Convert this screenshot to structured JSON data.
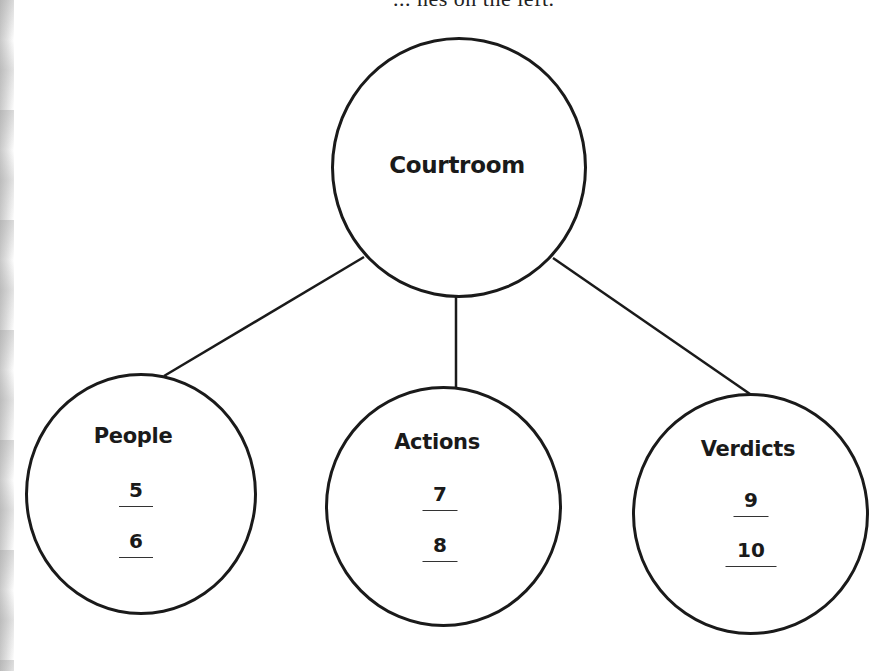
{
  "header_fragment": "... nes on the left.",
  "diagram": {
    "root": {
      "label": "Courtroom"
    },
    "children": [
      {
        "label": "People",
        "blanks": [
          "5",
          "6"
        ]
      },
      {
        "label": "Actions",
        "blanks": [
          "7",
          "8"
        ]
      },
      {
        "label": "Verdicts",
        "blanks": [
          "9",
          "10"
        ]
      }
    ]
  },
  "colors": {
    "ink": "#1a1a1a",
    "background": "#ffffff"
  }
}
